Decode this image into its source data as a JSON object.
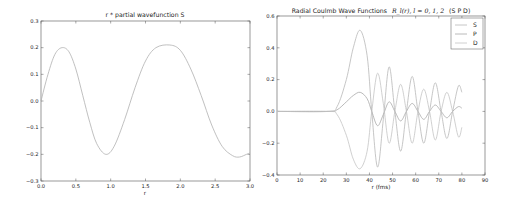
{
  "chart_data": [
    {
      "type": "line",
      "title": "r * partial wavefunction S",
      "xlabel": "r",
      "ylabel": "",
      "xlim": [
        0.0,
        3.0
      ],
      "ylim": [
        -0.3,
        0.3
      ],
      "xticks": [
        "0.0",
        "0.5",
        "1.0",
        "1.5",
        "2.0",
        "2.5",
        "3.0"
      ],
      "yticks": [
        "0.3",
        "0.2",
        "0.1",
        "0.0",
        "−0.1",
        "−0.2",
        "−0.3"
      ],
      "grid": false,
      "series": [
        {
          "name": "S",
          "color": "#b0b0b0",
          "x": [
            0.0,
            0.1,
            0.2,
            0.3,
            0.4,
            0.5,
            0.6,
            0.7,
            0.8,
            0.93,
            1.05,
            1.2,
            1.35,
            1.5,
            1.65,
            1.85,
            2.0,
            2.15,
            2.3,
            2.45,
            2.6,
            2.75,
            2.85,
            2.95,
            3.0
          ],
          "values": [
            0.0,
            0.1,
            0.175,
            0.2,
            0.185,
            0.12,
            0.02,
            -0.08,
            -0.16,
            -0.2,
            -0.17,
            -0.07,
            0.05,
            0.15,
            0.2,
            0.21,
            0.19,
            0.12,
            0.02,
            -0.09,
            -0.17,
            -0.205,
            -0.21,
            -0.2,
            -0.195
          ]
        }
      ]
    },
    {
      "type": "line",
      "title": "Radial Coulmb Wave Functions",
      "title_math": "R_l(r), l = 0, 1, 2",
      "title_suffix": "(S P D)",
      "xlabel": "r (fms)",
      "ylabel": "",
      "xlim": [
        0,
        90
      ],
      "ylim": [
        -0.4,
        0.6
      ],
      "xticks": [
        "0",
        "10",
        "20",
        "30",
        "40",
        "50",
        "60",
        "70",
        "80",
        "90"
      ],
      "yticks": [
        "0.6",
        "0.4",
        "0.2",
        "0.0",
        "−0.2",
        "−0.4"
      ],
      "grid": false,
      "legend": {
        "position": "upper right",
        "entries": [
          "S",
          "P",
          "D"
        ]
      },
      "series": [
        {
          "name": "S",
          "color": "#b8b8b8",
          "x": [
            0,
            22,
            26,
            30,
            33,
            36,
            39,
            41,
            43.5,
            46,
            48.5,
            51,
            53.5,
            56,
            58.5,
            61,
            63.5,
            66,
            68.5,
            71,
            73.5,
            76,
            78.5,
            80
          ],
          "values": [
            0.0,
            0.0,
            0.03,
            0.2,
            0.4,
            0.51,
            0.35,
            0.0,
            -0.35,
            -0.05,
            0.28,
            0.0,
            -0.25,
            0.0,
            0.22,
            0.0,
            -0.2,
            0.0,
            0.18,
            0.0,
            -0.17,
            0.0,
            0.16,
            0.12
          ]
        },
        {
          "name": "P",
          "color": "#a8a8a8",
          "x": [
            0,
            22,
            26,
            30,
            33,
            36,
            39,
            41,
            43.5,
            46,
            48.5,
            51,
            53.5,
            56,
            58.5,
            61,
            63.5,
            66,
            68.5,
            71,
            73.5,
            76,
            78.5,
            80
          ],
          "values": [
            0.0,
            0.0,
            0.01,
            0.06,
            0.1,
            0.12,
            0.08,
            0.0,
            -0.09,
            -0.02,
            0.06,
            0.0,
            -0.06,
            0.0,
            0.05,
            0.0,
            -0.05,
            0.0,
            0.04,
            0.0,
            -0.04,
            0.0,
            0.03,
            0.02
          ]
        },
        {
          "name": "D",
          "color": "#c4c4c4",
          "x": [
            0,
            22,
            26,
            30,
            33,
            36,
            39,
            41,
            43.5,
            46,
            48.5,
            51,
            53.5,
            56,
            58.5,
            61,
            63.5,
            66,
            68.5,
            71,
            73.5,
            76,
            78.5,
            80
          ],
          "values": [
            0.0,
            0.0,
            -0.02,
            -0.15,
            -0.3,
            -0.36,
            -0.25,
            0.0,
            0.24,
            0.05,
            -0.2,
            0.0,
            0.17,
            0.0,
            -0.2,
            0.0,
            0.14,
            0.0,
            -0.18,
            0.0,
            0.12,
            0.0,
            -0.16,
            -0.1
          ]
        }
      ]
    }
  ]
}
